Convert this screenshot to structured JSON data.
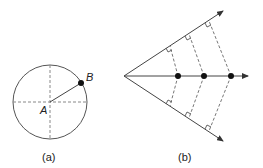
{
  "figure_a": {
    "caption": "(a)",
    "center_label": "A",
    "point_label": "B",
    "circle": {
      "cx": 50,
      "cy": 102,
      "r": 37
    },
    "point_b": {
      "x": 81,
      "y": 83
    }
  },
  "figure_b": {
    "caption": "(b)",
    "apex": {
      "x": 124,
      "y": 76
    },
    "axis_end": {
      "x": 248,
      "y": 76
    },
    "upper_ray_end": {
      "x": 223,
      "y": 11
    },
    "lower_ray_end": {
      "x": 223,
      "y": 141
    },
    "points_on_axis": [
      {
        "x": 178,
        "y": 76
      },
      {
        "x": 204,
        "y": 76
      },
      {
        "x": 231,
        "y": 76
      }
    ]
  },
  "colors": {
    "line": "#333333",
    "dashed": "#777777",
    "point": "#111111"
  }
}
